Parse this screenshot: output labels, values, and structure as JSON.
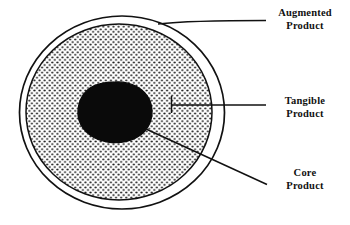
{
  "diagram": {
    "type": "concentric-circles",
    "ink_color": "#111111",
    "background_color": "#ffffff",
    "fill_core_color": "#0a0a0a",
    "fill_tangible_pattern": "stipple-dots",
    "fill_augmented_color": "#ffffff",
    "rings": [
      {
        "id": "augmented",
        "label_line1": "Augmented",
        "label_line2": "Product",
        "shape": "ellipse-outline",
        "leader": "horizontal"
      },
      {
        "id": "tangible",
        "label_line1": "Tangible",
        "label_line2": "Product",
        "shape": "ellipse-stippled",
        "leader": "horizontal-with-tick"
      },
      {
        "id": "core",
        "label_line1": "Core",
        "label_line2": "Product",
        "shape": "blob-solid-black",
        "leader": "diagonal"
      }
    ]
  }
}
